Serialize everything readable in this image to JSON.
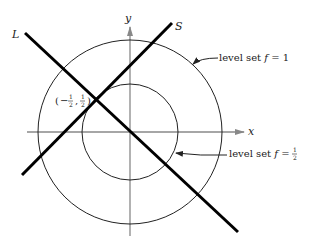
{
  "figure": {
    "axes": {
      "x_label": "x",
      "y_label": "y"
    },
    "lines": [
      {
        "name": "L",
        "label": "L"
      },
      {
        "name": "S",
        "label": "S"
      }
    ],
    "point": {
      "label": "(−½, ½)",
      "x_text": "−",
      "num": "1",
      "den": "2"
    },
    "level_sets": [
      {
        "label_text": "level set ",
        "f": "f",
        "eq": " = ",
        "value": "1"
      },
      {
        "label_text": "level set ",
        "f": "f",
        "eq": " = ",
        "value_num": "1",
        "value_den": "2"
      }
    ],
    "colors": {
      "curve": "#222222",
      "axis": "#888888",
      "line": "#000000"
    }
  }
}
